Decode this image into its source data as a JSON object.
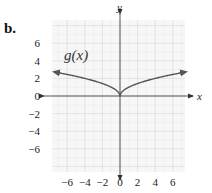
{
  "part_label": "b.",
  "chart_data": {
    "type": "line",
    "title": "",
    "function_label": "g(x)",
    "xlabel": "x",
    "ylabel": "y",
    "xlim": [
      -8,
      8
    ],
    "ylim": [
      -8,
      8
    ],
    "x_ticks": [
      -6,
      -4,
      -2,
      0,
      2,
      4,
      6
    ],
    "y_ticks": [
      6,
      4,
      2,
      0,
      -2,
      -4,
      -6
    ],
    "x_tick_labels": [
      "−6",
      "−4",
      "−2",
      "0",
      "2",
      "4",
      "6"
    ],
    "y_tick_labels": [
      "6",
      "4",
      "2",
      "0",
      "−2",
      "−4",
      "−6"
    ],
    "grid": true,
    "grid_minor_step": 1,
    "series": [
      {
        "name": "g(x)",
        "description": "cusp at origin, increasing on both sides, arrows at both ends",
        "x": [
          -7.5,
          -6,
          -4,
          -2,
          -1,
          -0.5,
          0,
          0.5,
          1,
          2,
          4,
          6,
          7.5
        ],
        "y": [
          2.74,
          2.45,
          2.0,
          1.41,
          1.0,
          0.71,
          0,
          0.71,
          1.0,
          1.41,
          2.0,
          2.45,
          2.74
        ]
      }
    ],
    "legend": "none",
    "colors": {
      "curve": "#555555",
      "axis": "#444444",
      "grid_major": "#d6d6d6",
      "grid_minor": "#ececec",
      "background": "#f7f7f7"
    }
  }
}
